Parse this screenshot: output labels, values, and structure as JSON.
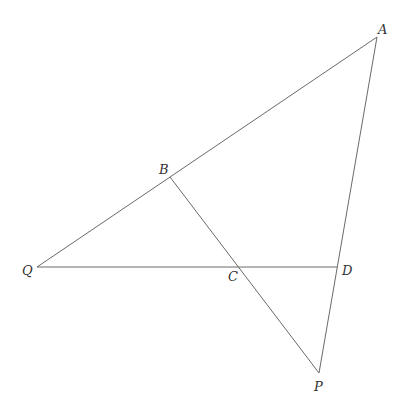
{
  "diagram": {
    "type": "geometry",
    "points": {
      "A": {
        "x": 377,
        "y": 37,
        "label": "A",
        "lx": 378,
        "ly": 34
      },
      "B": {
        "x": 170,
        "y": 177,
        "label": "B",
        "lx": 159,
        "ly": 174
      },
      "Q": {
        "x": 37,
        "y": 267,
        "label": "Q",
        "lx": 22,
        "ly": 275
      },
      "C": {
        "x": 239,
        "y": 267,
        "label": "C",
        "lx": 228,
        "ly": 281
      },
      "D": {
        "x": 337,
        "y": 267,
        "label": "D",
        "lx": 342,
        "ly": 275
      },
      "P": {
        "x": 319,
        "y": 373,
        "label": "P",
        "lx": 314,
        "ly": 391
      }
    },
    "segments": [
      {
        "name": "segment-QA",
        "from": "Q",
        "to": "A"
      },
      {
        "name": "segment-QD",
        "from": "Q",
        "to": "D"
      },
      {
        "name": "segment-AP",
        "from": "A",
        "to": "P"
      },
      {
        "name": "segment-BP",
        "from": "B",
        "to": "P"
      }
    ],
    "line_color": "#6a6a6a",
    "label_color": "#333333"
  }
}
